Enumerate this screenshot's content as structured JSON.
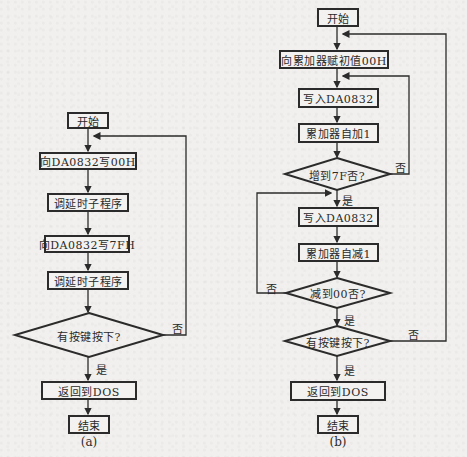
{
  "diagram_a": {
    "caption": "(a)",
    "start": "开始",
    "step1": "向DA0832写00H",
    "step2": "调延时子程序",
    "step3": "向DA0832写7FH",
    "step4": "调延时子程序",
    "decision": "有按键按下?",
    "yes_label": "是",
    "no_label": "否",
    "step5": "返回到DOS",
    "end": "结束"
  },
  "diagram_b": {
    "caption": "(b)",
    "start": "开始",
    "step1": "向累加器赋初值00H",
    "step2": "写入DA0832",
    "step3": "累加器自加1",
    "decision1": "增到7F否?",
    "decision1_no": "否",
    "decision1_yes": "是",
    "step4": "写入DA0832",
    "step5": "累加器自减1",
    "decision2": "减到00否?",
    "decision2_no": "否",
    "decision2_yes": "是",
    "decision3": "有按键按下?",
    "decision3_no": "否",
    "decision3_yes": "是",
    "step6": "返回到DOS",
    "end": "结束"
  },
  "colors": {
    "line": "#2b2b2b",
    "background": "#f1f0ee"
  }
}
